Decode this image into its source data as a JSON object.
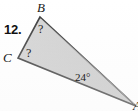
{
  "figure": {
    "problem_number": "12.",
    "background_color": "#ffffff",
    "fill_color": "#cfcfcf",
    "stroke_color": "#3a3a3a",
    "text_color": "#1a1a1a",
    "vertices": [
      {
        "name": "B",
        "label": "B",
        "x": 40,
        "y": 17
      },
      {
        "name": "C",
        "label": "C",
        "x": 18,
        "y": 58
      },
      {
        "name": "A",
        "label": "A",
        "x": 136,
        "y": 106
      }
    ],
    "angles": [
      {
        "at": "B",
        "label": "?",
        "value": null
      },
      {
        "at": "C",
        "label": "?",
        "value": null
      },
      {
        "at": "A",
        "label": "24°",
        "value": 24
      }
    ],
    "polygon_points": "40,17 18,58 136,106",
    "unknown_marker": "?",
    "degree_symbol": "°"
  }
}
